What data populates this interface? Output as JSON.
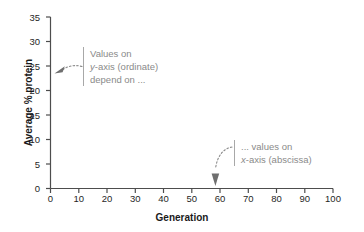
{
  "chart_data": {
    "type": "scatter",
    "title": "",
    "subtitle": "",
    "xlabel": "Generation",
    "ylabel": "Average % protein",
    "xlim": [
      0,
      100
    ],
    "ylim": [
      0,
      35
    ],
    "xticks": [
      0,
      10,
      20,
      30,
      40,
      50,
      60,
      70,
      80,
      90,
      100
    ],
    "yticks": [
      0,
      5,
      10,
      15,
      20,
      25,
      30,
      35
    ],
    "xtick_labels": [
      "0",
      "10",
      "20",
      "30",
      "40",
      "50",
      "60",
      "70",
      "80",
      "90",
      "100"
    ],
    "ytick_labels": [
      "0",
      "5",
      "10",
      "15",
      "20",
      "25",
      "30",
      "35"
    ],
    "grid": false,
    "legend": false,
    "series": [],
    "values": [],
    "categories": [],
    "annotations": [
      {
        "id": "y-axis-callout",
        "lines": [
          "Values on",
          "y-axis (ordinate)",
          "depend on ..."
        ],
        "italic_token": "y",
        "points_to_axis": "y",
        "target_value": 22.5,
        "arrow_style": "dotted-curve-arrow"
      },
      {
        "id": "x-axis-callout",
        "lines": [
          "... values on",
          "x-axis (abscissa)"
        ],
        "italic_token": "x",
        "points_to_axis": "x",
        "target_value": 56,
        "arrow_style": "dotted-curve-arrow"
      }
    ],
    "colors": {
      "axis": "#4d4d4d",
      "tick_label": "#1f1f1f",
      "axis_title": "#1a1a1a",
      "annotation_text": "#8a8a8a",
      "annotation_rule": "#a8a8a8",
      "annotation_arrow": "#808080",
      "background": "#ffffff"
    }
  }
}
